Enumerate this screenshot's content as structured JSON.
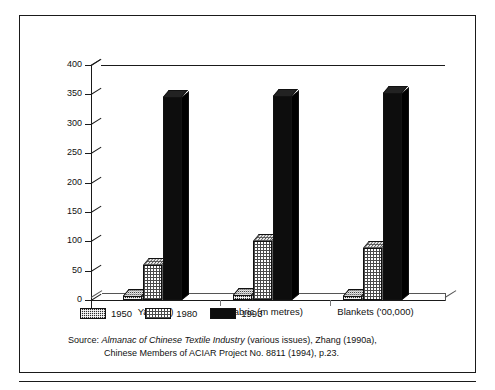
{
  "chart_data": {
    "type": "bar",
    "title": "",
    "subtitle": "",
    "xlabel": "",
    "ylabel": "",
    "ylim": [
      0,
      400
    ],
    "yticks": [
      0,
      50,
      100,
      150,
      200,
      250,
      300,
      350,
      400
    ],
    "ytick_labels": [
      "0",
      "50",
      "100",
      "150",
      "200",
      "250",
      "300",
      "350",
      "400"
    ],
    "grid": false,
    "legend_position": "bottom-left",
    "categories": [
      "Yarn (kt)",
      "Fabric (m metres)",
      "Blankets ('00,000)"
    ],
    "series": [
      {
        "name": "1950",
        "values": [
          6,
          8,
          7
        ],
        "pattern": "dark-dither",
        "color": "#2b2b2b"
      },
      {
        "name": "1980",
        "values": [
          60,
          100,
          88
        ],
        "pattern": "light-dither",
        "color": "#d8d8d8"
      },
      {
        "name": "1993",
        "values": [
          345,
          348,
          352
        ],
        "pattern": "solid",
        "color": "#0d0d0d"
      }
    ]
  },
  "legend": {
    "items": [
      {
        "label": "1950"
      },
      {
        "label": "1980"
      },
      {
        "label": "1993"
      }
    ]
  },
  "source": {
    "label": "Source:",
    "italic_title": "Almanac of Chinese Textile Industry",
    "rest_line1": "(various issues), Zhang (1990a),",
    "line2": "Chinese Members of ACIAR Project No. 8811 (1994), p.23."
  }
}
